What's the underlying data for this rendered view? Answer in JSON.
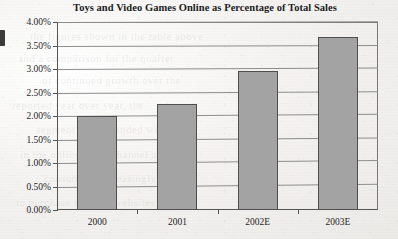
{
  "chart_data": {
    "type": "bar",
    "title": "Toys and Video Games Online as Percentage of Total Sales",
    "xlabel": "",
    "ylabel": "",
    "categories": [
      "2000",
      "2001",
      "2002E",
      "2003E"
    ],
    "values": [
      2.0,
      2.25,
      2.95,
      3.68
    ],
    "value_labels": [
      "2.00%",
      "2.25%",
      "2.95%",
      "3.68%"
    ],
    "series": [
      {
        "name": "Toys and Video Games Online as Percentage of Total Sales",
        "values": [
          2.0,
          2.25,
          2.95,
          3.68
        ]
      }
    ],
    "ylim": [
      0.0,
      4.0
    ],
    "ytick_values": [
      0.0,
      0.5,
      1.0,
      1.5,
      2.0,
      2.5,
      3.0,
      3.5,
      4.0
    ],
    "ytick_labels": [
      "0.00%",
      "0.50%",
      "1.00%",
      "1.50%",
      "2.00%",
      "2.50%",
      "3.00%",
      "3.50%",
      "4.00%"
    ],
    "grid": true,
    "legend": false,
    "legend_position": "none",
    "bar_color": "#a3a3a3",
    "bar_edge_color": "#4e4e4e",
    "axis_color": "#555555",
    "gridline_color": "#8d8d8d",
    "background_color": "#f3f2f0"
  },
  "artifacts": {
    "bleed_text": [
      "the figures shown in the table above",
      "and a comparison for the quarter",
      "of continued growth over the",
      "reported year over year, the",
      "segment has expanded with",
      "in the online retail channel as",
      "consumers increasingly prefer",
      "to purchase through websites"
    ]
  }
}
